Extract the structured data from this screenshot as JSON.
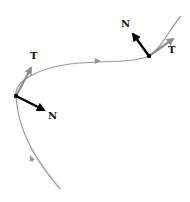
{
  "diagram": {
    "colors": {
      "curve": "#9a9a9a",
      "tangent": "#8f8f8f",
      "normal": "#000000",
      "point": "#000000",
      "label": "#111111"
    },
    "points": [
      {
        "id": "p1",
        "x": 16,
        "y": 96,
        "tangent": {
          "label": "T",
          "to": [
            33,
            65
          ],
          "label_pos": [
            33,
            58
          ]
        },
        "normal": {
          "label": "N",
          "to": [
            47,
            111
          ],
          "label_pos": [
            50,
            119
          ]
        }
      },
      {
        "id": "p2",
        "x": 149,
        "y": 56,
        "tangent": {
          "label": "T",
          "to": [
            176,
            37
          ],
          "label_pos": [
            170,
            52
          ]
        },
        "normal": {
          "label": "N",
          "to": [
            131,
            31
          ],
          "label_pos": [
            123,
            25
          ]
        }
      }
    ],
    "labels": {
      "t1": "T",
      "n1": "N",
      "t2": "T",
      "n2": "N"
    }
  }
}
